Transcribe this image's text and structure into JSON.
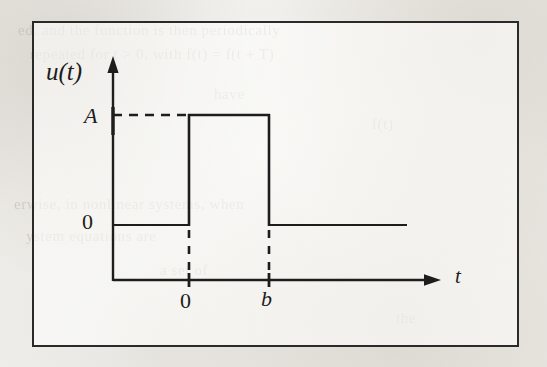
{
  "figure": {
    "caption_labels": {
      "y_axis_function": "u(t)",
      "amplitude": "A",
      "y_zero": "0",
      "x_zero": "0",
      "x_pulse_end": "b",
      "x_axis_variable": "t"
    },
    "colors": {
      "ink": "#1d1d1b",
      "frame": "#2a2a28",
      "paper": "#f1efea"
    }
  },
  "background_showthrough": [
    {
      "text": "ed, and the function is then periodically",
      "x": 18,
      "y": 22
    },
    {
      "text": "repeated for t > 0, with f(t) = f(t + T)",
      "x": 30,
      "y": 46
    },
    {
      "text": "have",
      "x": 214,
      "y": 86
    },
    {
      "text": "f(t)",
      "x": 372,
      "y": 116
    },
    {
      "text": "erwise, in  nonlinear  systems, when",
      "x": 14,
      "y": 196
    },
    {
      "text": "ystem  equations  are",
      "x": 26,
      "y": 228
    },
    {
      "text": "a  set  of",
      "x": 160,
      "y": 262
    },
    {
      "text": "the",
      "x": 396,
      "y": 310
    }
  ],
  "chart_data": {
    "type": "line",
    "title": "",
    "xlabel": "t",
    "ylabel": "u(t)",
    "x_ticks": [
      {
        "label": "0",
        "value": 0
      },
      {
        "label": "b",
        "value": 1
      }
    ],
    "y_ticks": [
      {
        "label": "0",
        "value": 0
      },
      {
        "label": "A",
        "value": 1
      }
    ],
    "series": [
      {
        "name": "u(t)",
        "points": [
          {
            "x": -1.0,
            "y": 0
          },
          {
            "x": 0.0,
            "y": 0
          },
          {
            "x": 0.0,
            "y": 1
          },
          {
            "x": 1.0,
            "y": 1
          },
          {
            "x": 1.0,
            "y": 0
          },
          {
            "x": 2.8,
            "y": 0
          }
        ],
        "style": "solid"
      }
    ],
    "guides": [
      {
        "name": "amplitude-guide",
        "from": {
          "x": -1.0,
          "y": 1
        },
        "to": {
          "x": 0.0,
          "y": 1
        },
        "style": "dashed",
        "orientation": "horizontal"
      },
      {
        "name": "pulse-start-guide",
        "from": {
          "x": 0.0,
          "y": 0
        },
        "to": {
          "x": 0.0,
          "y": -0.75
        },
        "style": "dashed",
        "orientation": "vertical"
      },
      {
        "name": "pulse-end-guide",
        "from": {
          "x": 1.0,
          "y": 0
        },
        "to": {
          "x": 1.0,
          "y": -0.75
        },
        "style": "dashed",
        "orientation": "vertical"
      }
    ],
    "grid": false,
    "legend": "none",
    "axis_arrows": {
      "x": true,
      "y": true
    }
  }
}
